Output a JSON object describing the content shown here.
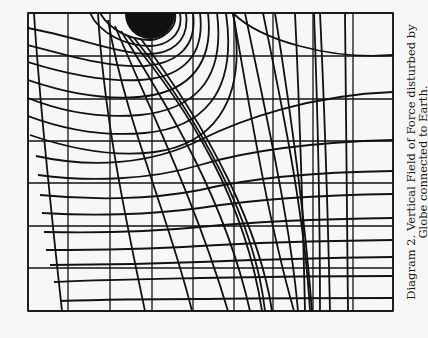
{
  "figure": {
    "caption_line_1": "Diagram 2.  Vertical Field of Force disturbed by",
    "caption_line_2": "Globe connected to Earth.",
    "colors": {
      "ink": "#111111",
      "paper": "#f7f7f5"
    },
    "frame": {
      "x0": 28,
      "y0": 13,
      "x1": 393,
      "y1": 311
    },
    "grid": {
      "vertical_x": [
        28,
        68,
        110,
        152,
        193,
        234,
        273,
        313,
        353,
        393
      ],
      "horizontal_y": [
        13,
        56,
        99,
        141,
        183,
        226,
        268,
        311
      ]
    },
    "globe": {
      "cx": 150,
      "cy": 14,
      "r": 25
    },
    "field_lines": [
      "M34,13 C40,110 52,220 62,311",
      "M98,13 C104,120 128,230 145,311",
      "M108,20 C125,120 170,220 192,311",
      "M115,26 C150,110 195,200 228,311",
      "M121,31 C170,110 225,200 250,311",
      "M127,35 C190,110 245,200 262,311",
      "M134,38 C200,120 255,220 265,311",
      "M141,39 C210,130 260,230 272,311",
      "M233,13 C250,110 268,220 294,311",
      "M245,13 C265,110 290,220 298,311",
      "M263,13 C285,120 305,220 310,311",
      "M275,13 C292,120 305,220 312,311",
      "M295,13 C300,120 303,220 305,311",
      "M314,13 C318,120 320,220 320,311",
      "M320,13 C325,120 328,220 330,311",
      "M345,13 C346,120 347,220 348,311"
    ],
    "equipotentials": [
      "M175,13 C178,30 160,40 150,40 C130,40 110,30 100,13",
      "M180,13 C184,36 165,46 150,46 C128,46 100,35 90,13",
      "M186,13 C190,44 168,54 148,54 C120,54 80,38 28,28",
      "M193,13 C198,52 170,64 145,66 C110,68 70,56 28,45",
      "M200,13 C206,62 175,78 140,80 C100,82 60,72 28,62",
      "M208,13 C215,72 180,94 138,97 C95,100 58,90 28,80",
      "M217,13 C226,84 190,110 140,115 C95,119 58,110 28,98",
      "M226,13 C238,96 200,128 145,133 C100,137 60,128 28,116",
      "M233,13 C250,110 205,145 155,152 C110,158 65,147 30,135",
      "M393,55 C330,60 260,40 233,13",
      "M393,92 C310,95 240,120 200,140 C150,165 90,168 36,156",
      "M393,140 C320,142 250,150 200,165 C150,180 90,182 38,175",
      "M393,171 C320,172 250,178 200,190 C150,200 90,200 40,195",
      "M393,194 C320,195 250,200 200,208 C150,215 90,216 42,213",
      "M393,218 C320,219 250,222 200,227 C150,232 90,233 44,232",
      "M393,240 C320,241 250,243 200,246 C150,249 90,250 46,250",
      "M393,257 C320,258 250,260 200,262 C150,264 90,265 50,265",
      "M393,276 C320,276 250,277 200,278 C150,279 90,280 54,282",
      "M393,298 C320,298 250,298 200,299 C150,299 90,300 60,301"
    ]
  }
}
